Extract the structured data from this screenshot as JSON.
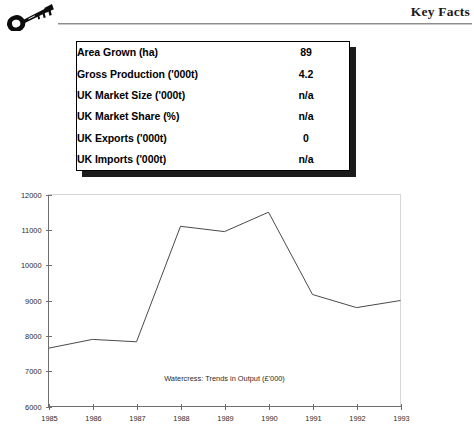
{
  "header": {
    "title": "Key Facts",
    "icon": "key-icon"
  },
  "facts": {
    "rows": [
      {
        "label": "Area Grown (ha)",
        "value": "89"
      },
      {
        "label": "Gross Production ('000t)",
        "value": "4.2"
      },
      {
        "label": "UK Market Size ('000t)",
        "value": "n/a"
      },
      {
        "label": "UK Market Share (%)",
        "value": "n/a"
      },
      {
        "label": "UK Exports ('000t)",
        "value": "0"
      },
      {
        "label": "UK Imports ('000t)",
        "value": "n/a"
      }
    ]
  },
  "chart_data": {
    "type": "line",
    "title": "",
    "caption": "Watercress: Trends in Output (£'000)",
    "xlabel": "",
    "ylabel": "",
    "x": [
      "1985",
      "1986",
      "1987",
      "1988",
      "1989",
      "1990",
      "1991",
      "1992",
      "1993"
    ],
    "series": [
      {
        "name": "Output",
        "values": [
          7650,
          7900,
          7830,
          11100,
          10950,
          11500,
          9170,
          8800,
          9000
        ]
      }
    ],
    "ylim": [
      6000,
      12000
    ],
    "yticks": [
      6000,
      7000,
      8000,
      9000,
      10000,
      11000,
      12000
    ],
    "ytick_labels": [
      "6000",
      "7000",
      "8000",
      "9000",
      "10000",
      "11000",
      "12000"
    ],
    "xtick_labels": [
      "1985",
      "1986",
      "1987",
      "1988",
      "1989",
      "1990",
      "1991",
      "1992",
      "1993"
    ],
    "grid": false,
    "legend": "none",
    "line_color": "#4a4a4a"
  }
}
